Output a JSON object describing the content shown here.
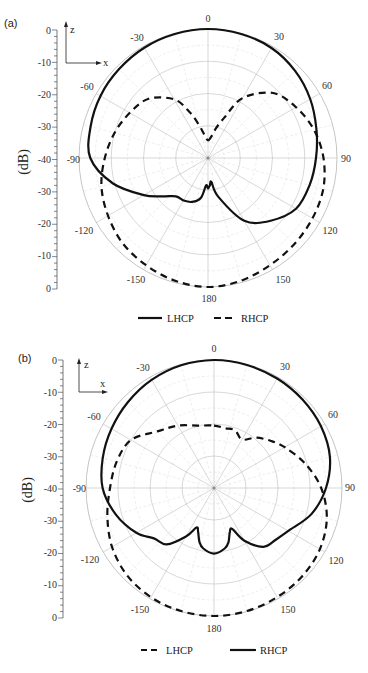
{
  "chart_data": [
    {
      "type": "line",
      "subtype": "polar",
      "panel": "(a)",
      "title": "",
      "radial_axis": {
        "label": "(dB)",
        "ticks": [
          0,
          -10,
          -20,
          -30,
          -40,
          -30,
          -20,
          -10,
          0
        ],
        "range": [
          -40,
          0
        ]
      },
      "angular_ticks": [
        0,
        30,
        60,
        90,
        120,
        150,
        180,
        -150,
        -120,
        -90,
        -60,
        -30
      ],
      "angle_unit": "deg",
      "coordinate_inset": {
        "up": "z",
        "right": "x"
      },
      "grid": true,
      "legend": {
        "position": "bottom",
        "entries": [
          {
            "label": "LHCP",
            "style": "solid"
          },
          {
            "label": "RHCP",
            "style": "dashed"
          }
        ]
      },
      "series": [
        {
          "name": "LHCP",
          "style": "solid",
          "theta": [
            0,
            15,
            30,
            45,
            60,
            75,
            90,
            105,
            120,
            135,
            150,
            165,
            172,
            176,
            180,
            -176,
            -170,
            -160,
            -150,
            -140,
            -130,
            -120,
            -105,
            -90,
            -75,
            -60,
            -45,
            -30,
            -15
          ],
          "values": [
            0,
            -0.2,
            -0.6,
            -1.8,
            -3.4,
            -5.2,
            -6.5,
            -7.4,
            -8.5,
            -12.5,
            -17.5,
            -27.5,
            -32.5,
            -31.5,
            -30.5,
            -31.5,
            -27.5,
            -25.5,
            -24.8,
            -24.5,
            -21.5,
            -17.0,
            -9.5,
            -3.5,
            -2.3,
            -1.5,
            -1.0,
            -0.5,
            -0.2
          ]
        },
        {
          "name": "RHCP",
          "style": "dashed",
          "theta": [
            0,
            8,
            15,
            22,
            30,
            45,
            60,
            75,
            90,
            105,
            120,
            135,
            150,
            165,
            180,
            -165,
            -150,
            -135,
            -120,
            -105,
            -90,
            -75,
            -60,
            -45,
            -30,
            -22,
            -15,
            -8
          ],
          "values": [
            -34.5,
            -33.5,
            -30.5,
            -26.5,
            -18.5,
            -11.5,
            -8.5,
            -6.0,
            -4.2,
            -3.0,
            -2.6,
            -2.2,
            -1.6,
            -0.6,
            0,
            -0.6,
            -1.6,
            -2.6,
            -4.2,
            -5.8,
            -8.0,
            -10.0,
            -12.0,
            -14.0,
            -19.0,
            -24.5,
            -29.5,
            -33.0
          ]
        }
      ]
    },
    {
      "type": "line",
      "subtype": "polar",
      "panel": "(b)",
      "title": "",
      "radial_axis": {
        "label": "(dB)",
        "ticks": [
          0,
          -10,
          -20,
          -30,
          -40,
          -30,
          -20,
          -10,
          0
        ],
        "range": [
          -40,
          0
        ]
      },
      "angular_ticks": [
        0,
        30,
        60,
        90,
        120,
        150,
        180,
        -150,
        -120,
        -90,
        -60,
        -30
      ],
      "angle_unit": "deg",
      "coordinate_inset": {
        "up": "z",
        "right": "x"
      },
      "grid": true,
      "legend": {
        "position": "bottom",
        "entries": [
          {
            "label": "LHCP",
            "style": "dashed"
          },
          {
            "label": "RHCP",
            "style": "solid"
          }
        ]
      },
      "series": [
        {
          "name": "LHCP",
          "style": "dashed",
          "theta": [
            0,
            10,
            20,
            30,
            40,
            50,
            60,
            75,
            90,
            105,
            120,
            135,
            150,
            165,
            180,
            -165,
            -150,
            -135,
            -120,
            -105,
            -90,
            -75,
            -60,
            -45,
            -30,
            -15
          ],
          "values": [
            -20.5,
            -21.0,
            -20.8,
            -22.5,
            -19.5,
            -17.0,
            -14.5,
            -10.5,
            -6.5,
            -3.5,
            -1.8,
            -1.0,
            -0.6,
            -0.2,
            0,
            -0.2,
            -0.6,
            -1.5,
            -3.2,
            -5.5,
            -7.5,
            -8.5,
            -10.0,
            -15.0,
            -17.5,
            -19.8
          ]
        },
        {
          "name": "RHCP",
          "style": "solid",
          "theta": [
            0,
            15,
            30,
            45,
            60,
            75,
            90,
            105,
            120,
            130,
            140,
            150,
            156,
            160,
            165,
            170,
            180,
            -170,
            -165,
            -160,
            -156,
            -150,
            -140,
            -130,
            -120,
            -105,
            -90,
            -75,
            -60,
            -45,
            -30,
            -15
          ],
          "values": [
            0,
            -0.2,
            -0.5,
            -0.9,
            -1.4,
            -2.5,
            -5.0,
            -8.5,
            -13.2,
            -14.8,
            -16.0,
            -21.0,
            -26.0,
            -25.5,
            -22.5,
            -20.8,
            -19.5,
            -20.8,
            -22.5,
            -25.5,
            -26.5,
            -22.5,
            -17.0,
            -15.5,
            -12.0,
            -8.2,
            -5.2,
            -4.0,
            -3.0,
            -2.0,
            -1.0,
            -0.3
          ]
        }
      ]
    }
  ],
  "panels": [
    {
      "label": "(a)",
      "ylabel": "(dB)",
      "scale_ticks": [
        "0",
        "-10",
        "-20",
        "-30",
        "-40",
        "-30",
        "-20",
        "-10",
        "0"
      ],
      "inset": {
        "z": "z",
        "x": "x"
      },
      "angle_labels": {
        "a0": "0",
        "a30": "30",
        "a60": "60",
        "a90": "90",
        "a120": "120",
        "a150": "150",
        "a180": "180",
        "am150": "-150",
        "am120": "-120",
        "am90": "-90",
        "am60": "-60",
        "am30": "-30"
      },
      "legend": {
        "first": "LHCP",
        "second": "RHCP"
      }
    },
    {
      "label": "(b)",
      "ylabel": "(dB)",
      "scale_ticks": [
        "0",
        "-10",
        "-20",
        "-30",
        "-40",
        "-30",
        "-20",
        "-10",
        "0"
      ],
      "inset": {
        "z": "z",
        "x": "x"
      },
      "angle_labels": {
        "a0": "0",
        "a30": "30",
        "a60": "60",
        "a90": "90",
        "a120": "120",
        "a150": "150",
        "a180": "180",
        "am150": "-150",
        "am120": "-120",
        "am90": "-90",
        "am60": "-60",
        "am30": "-30"
      },
      "legend": {
        "first": "LHCP",
        "second": "RHCP"
      }
    }
  ],
  "colors": {
    "curve": "#111111",
    "grid": "#bdbdbd",
    "grid_minor": "#e2e2e2",
    "axis": "#555555"
  }
}
